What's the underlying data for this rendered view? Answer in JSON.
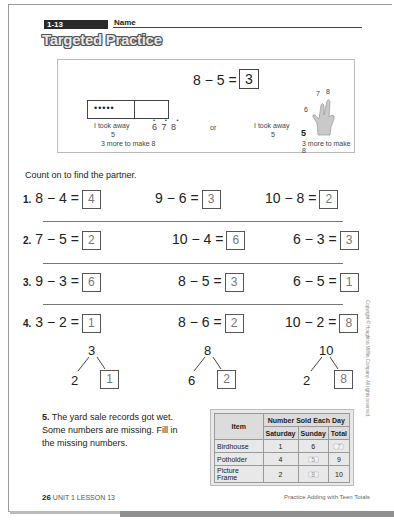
{
  "header": {
    "lesson_tag": "1-13",
    "name_label": "Name",
    "title": "Targeted Practice"
  },
  "example": {
    "equation": "8 − 5 =",
    "answer": "3",
    "frame_dots": "•••••",
    "count_on_dots": "• • •",
    "count_on_numbers": "6 7 8",
    "took_away_label": "I took away",
    "took_away_value": "5",
    "more_to_make": "3 more to make 8",
    "or_label": "or",
    "hand_took_away_label": "I took away",
    "hand_took_away_value": "5",
    "hand_start": "5",
    "hand_finger_labels": [
      "6",
      "7",
      "8"
    ],
    "hand_more_to_make": "3 more to make 8"
  },
  "instruction": "Count on to find the partner.",
  "problems": [
    {
      "number": "1.",
      "items": [
        {
          "expr": "8 − 4 =",
          "answer": "4"
        },
        {
          "expr": "9 − 6 =",
          "answer": "3"
        },
        {
          "expr": "10 − 8 =",
          "answer": "2"
        }
      ]
    },
    {
      "number": "2.",
      "items": [
        {
          "expr": "7 − 5 =",
          "answer": "2"
        },
        {
          "expr": "10 − 4 =",
          "answer": "6"
        },
        {
          "expr": "6 − 3 =",
          "answer": "3"
        }
      ]
    },
    {
      "number": "3.",
      "items": [
        {
          "expr": "9 − 3 =",
          "answer": "6"
        },
        {
          "expr": "8 − 5 =",
          "answer": "3"
        },
        {
          "expr": "6 − 5 =",
          "answer": "1"
        }
      ]
    },
    {
      "number": "4.",
      "items": [
        {
          "expr": "3 − 2 =",
          "answer": "1"
        },
        {
          "expr": "8 − 6 =",
          "answer": "2"
        },
        {
          "expr": "10 − 2 =",
          "answer": "8"
        }
      ]
    }
  ],
  "number_bonds": [
    {
      "total": "3",
      "part": "2",
      "answer": "1"
    },
    {
      "total": "8",
      "part": "6",
      "answer": "2"
    },
    {
      "total": "10",
      "part": "2",
      "answer": "8"
    }
  ],
  "question5": {
    "number": "5.",
    "text": "The yard sale records got wet. Some numbers are missing. Fill in the missing numbers."
  },
  "table": {
    "col_item": "Item",
    "group_header": "Number Sold Each Day",
    "col_saturday": "Saturday",
    "col_sunday": "Sunday",
    "col_total": "Total",
    "rows": [
      {
        "item": "Birdhouse",
        "saturday": "1",
        "sunday": "6",
        "total": "7"
      },
      {
        "item": "Potholder",
        "saturday": "4",
        "sunday": "5",
        "total": "9"
      },
      {
        "item": "Picture Frame",
        "saturday": "2",
        "sunday": "8",
        "total": "10"
      }
    ]
  },
  "footer": {
    "page_number": "26",
    "unit_lesson": "UNIT 1 LESSON 13",
    "right_text": "Practice Adding with Teen Totals"
  },
  "copyright": "Copyright © Houghton Mifflin Company. All rights reserved."
}
